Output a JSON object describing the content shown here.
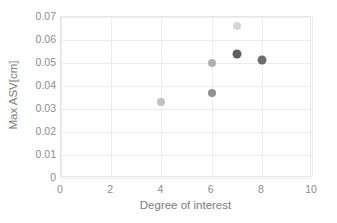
{
  "chart_data": {
    "type": "scatter",
    "title": "",
    "xlabel": "Degree of interest",
    "ylabel": "Max ASV[cm]",
    "xlim": [
      0,
      10
    ],
    "ylim": [
      0,
      0.07
    ],
    "xticks": [
      "0",
      "2",
      "4",
      "6",
      "8",
      "10"
    ],
    "xtick_values": [
      0,
      2,
      4,
      6,
      8,
      10
    ],
    "yticks": [
      "0",
      "0.01",
      "0.02",
      "0.03",
      "0.04",
      "0.05",
      "0.06",
      "0.07"
    ],
    "ytick_values": [
      0,
      0.01,
      0.02,
      0.03,
      0.04,
      0.05,
      0.06,
      0.07
    ],
    "grid": true,
    "legend": "none",
    "points": [
      {
        "name": "point-4-0033",
        "x": 4,
        "y": 0.033,
        "color": "#c2c2c2",
        "size": 8
      },
      {
        "name": "point-6-0050",
        "x": 6,
        "y": 0.05,
        "color": "#b0b0b0",
        "size": 8
      },
      {
        "name": "point-6-0037",
        "x": 6,
        "y": 0.037,
        "color": "#909090",
        "size": 8
      },
      {
        "name": "point-7-0066",
        "x": 7,
        "y": 0.066,
        "color": "#d6d6d6",
        "size": 8
      },
      {
        "name": "point-7-0054",
        "x": 7,
        "y": 0.054,
        "color": "#5e5e5e",
        "size": 9
      },
      {
        "name": "point-8-0051",
        "x": 8,
        "y": 0.0513,
        "color": "#6e6e6e",
        "size": 9
      }
    ],
    "colors": {
      "background": "#ffffff",
      "gridline": "#ececec",
      "border": "#e6e6e6",
      "tick_text": "#8c8c8c",
      "axis_title": "#7d7d7d"
    }
  }
}
